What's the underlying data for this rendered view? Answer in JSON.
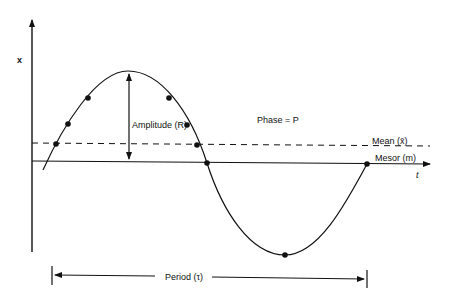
{
  "diagram": {
    "type": "cosinor-wave",
    "axes": {
      "y_label": "x",
      "x_label": "t"
    },
    "labels": {
      "amplitude": "Amplitude (R)",
      "phase": "Phase = P",
      "mean": "Mean (x̄)",
      "mesor": "Mesor (m)",
      "period": "Period (τ)"
    },
    "colors": {
      "ink": "#111111",
      "background": "#ffffff"
    }
  }
}
